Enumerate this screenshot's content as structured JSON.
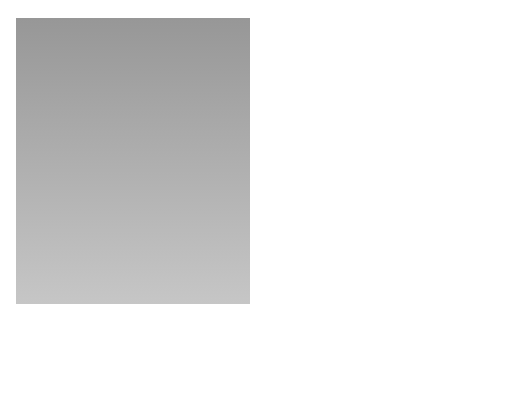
{
  "figure": {
    "panel_label": "(a)",
    "colors": {
      "background_top": "#9a9a9a",
      "background_bottom": "#c4c4c4",
      "plate": "#4a4a4a",
      "tube": "#8e8e8e",
      "spot": "#f2f2f2",
      "ray": "#2a2a2a",
      "atom_dark": "#555555",
      "atom_light": "#b8b8b8"
    }
  },
  "labels": {
    "xray_tube": "X-ray tube",
    "xray_beam_line1": "X-ray",
    "xray_beam_line2": "beam",
    "lead_screen": "Lead screen",
    "voltage": "10,000 – 40,000 V",
    "crystalline_solid": "Crystalline solid",
    "spots_diffracted_line1": "Spots from",
    "spots_diffracted_line2": "diffracted X rays",
    "spot_incident_line1": "Spot from",
    "spot_incident_line2": "incident beam",
    "photographic_plate_line1": "Photographic",
    "photographic_plate_line2": "plate"
  },
  "components": [
    {
      "id": "xray-tube",
      "label": "X-ray tube"
    },
    {
      "id": "lead-screen",
      "label": "Lead screen"
    },
    {
      "id": "crystalline-solid",
      "label": "Crystalline solid"
    },
    {
      "id": "photographic-plate",
      "label": "Photographic plate"
    },
    {
      "id": "crystal-lattice-inset",
      "label": "Crystal lattice (magnified)"
    }
  ]
}
